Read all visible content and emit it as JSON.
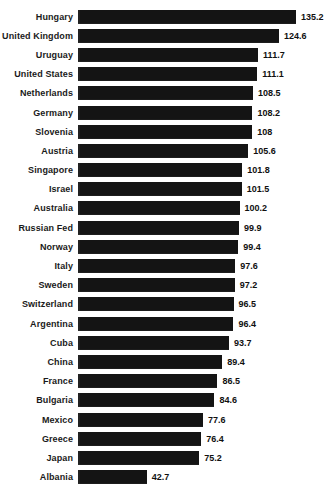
{
  "chart_data": {
    "type": "bar",
    "orientation": "horizontal",
    "title": "",
    "subtitle": "",
    "xlabel": "",
    "ylabel": "",
    "grid": false,
    "legend": null,
    "xlim": [
      0,
      135.2
    ],
    "value_labels_shown": true,
    "bar_color": "#141414",
    "background_color": "#ffffff",
    "categories": [
      "Hungary",
      "United Kingdom",
      "Uruguay",
      "United States",
      "Netherlands",
      "Germany",
      "Slovenia",
      "Austria",
      "Singapore",
      "Israel",
      "Australia",
      "Russian Fed",
      "Norway",
      "Italy",
      "Sweden",
      "Switzerland",
      "Argentina",
      "Cuba",
      "China",
      "France",
      "Bulgaria",
      "Mexico",
      "Greece",
      "Japan",
      "Albania"
    ],
    "values": [
      135.2,
      124.6,
      111.7,
      111.1,
      108.5,
      108.2,
      108,
      105.6,
      101.8,
      101.5,
      100.2,
      99.9,
      99.4,
      97.6,
      97.2,
      96.5,
      96.4,
      93.7,
      89.4,
      86.5,
      84.6,
      77.6,
      76.4,
      75.2,
      42.7
    ],
    "value_label_texts": [
      "135.2",
      "124.6",
      "111.7",
      "111.1",
      "108.5",
      "108.2",
      "108",
      "105.6",
      "101.8",
      "101.5",
      "100.2",
      "99.9",
      "99.4",
      "97.6",
      "97.2",
      "96.5",
      "96.4",
      "93.7",
      "89.4",
      "86.5",
      "84.6",
      "77.6",
      "76.4",
      "75.2",
      "42.7"
    ]
  }
}
